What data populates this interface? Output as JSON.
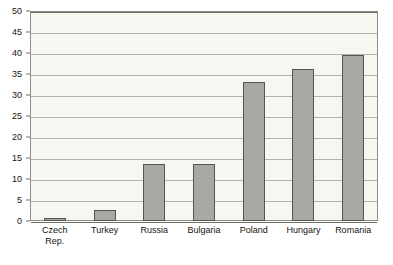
{
  "chart_data": {
    "type": "bar",
    "title": "",
    "subtitle": "",
    "xlabel": "",
    "ylabel": "",
    "categories": [
      "Czech Rep.",
      "Turkey",
      "Russia",
      "Bulgaria",
      "Poland",
      "Hungary",
      "Romania"
    ],
    "category_lines": [
      [
        "Czech",
        "Rep."
      ],
      [
        "Turkey"
      ],
      [
        "Russia"
      ],
      [
        "Bulgaria"
      ],
      [
        "Poland"
      ],
      [
        "Hungary"
      ],
      [
        "Romania"
      ]
    ],
    "values": [
      0.7,
      2.7,
      13.6,
      13.6,
      33.0,
      36.3,
      39.5
    ],
    "ylim": [
      0,
      50
    ],
    "ytick_labels": [
      "0",
      "5",
      "10",
      "15",
      "20",
      "25",
      "30",
      "35",
      "40",
      "45",
      "50"
    ],
    "ytick_values": [
      0,
      5,
      10,
      15,
      20,
      25,
      30,
      35,
      40,
      45,
      50
    ],
    "grid": true,
    "legend": null,
    "legend_position": "none",
    "colors": {
      "bar_fill": "#a8a8a4",
      "bar_border": "#55554f",
      "plot_background": "#f7f6f1",
      "gridline": "#b3b3ab",
      "axis": "#6e6e68",
      "frame": "#8d8d86",
      "text": "#15140f",
      "page_background": "#ffffff"
    }
  }
}
